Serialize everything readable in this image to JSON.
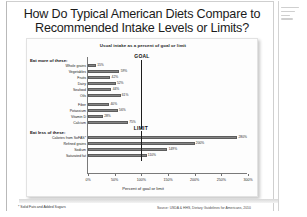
{
  "slide": {
    "title_line1": "How Do Typical American Diets Compare to",
    "title_line2": "Recommended Intake Levels or Limits?",
    "footnote": "* Solid Fats and Added Sugars",
    "source": "Source: USDA & HHS, Dietary Guidelines for Americans, 2010"
  },
  "right_pane": {
    "lines": [
      "",
      "",
      "",
      ""
    ]
  },
  "chart_data": {
    "type": "bar",
    "orientation": "horizontal",
    "title": "Usual intake as a percent of goal or limit",
    "xlabel": "Percent of goal or limit",
    "ylabel": "",
    "xlim": [
      0,
      300
    ],
    "xticks": [
      0,
      50,
      100,
      150,
      200,
      250,
      300
    ],
    "xtick_labels": [
      "0%",
      "50%",
      "100%",
      "150%",
      "200%",
      "250%",
      "300%"
    ],
    "grid": false,
    "legend": null,
    "groups": [
      {
        "name": "eat-more",
        "heading": "Eat more of these:",
        "reference_line": {
          "label": "GOAL",
          "value": 100
        },
        "categories": [
          "Whole grains",
          "Vegetables",
          "Fruits",
          "Dairy",
          "Seafood",
          "Oils",
          "Fiber",
          "Potassium",
          "Vitamin D",
          "Calcium"
        ],
        "values": [
          15,
          59,
          42,
          52,
          44,
          61,
          40,
          56,
          28,
          75
        ],
        "value_labels": [
          "15%",
          "59%",
          "42%",
          "52%",
          "44%",
          "61%",
          "40%",
          "56%",
          "28%",
          "75%"
        ]
      },
      {
        "name": "eat-less",
        "heading": "Eat less of these:",
        "reference_line": {
          "label": "LIMIT",
          "value": 100
        },
        "categories": [
          "Calories from SoFAS*",
          "Refined grains",
          "Sodium",
          "Saturated fat"
        ],
        "values": [
          280,
          200,
          149,
          110
        ],
        "value_labels": [
          "280%",
          "200%",
          "149%",
          "110%"
        ]
      }
    ]
  }
}
